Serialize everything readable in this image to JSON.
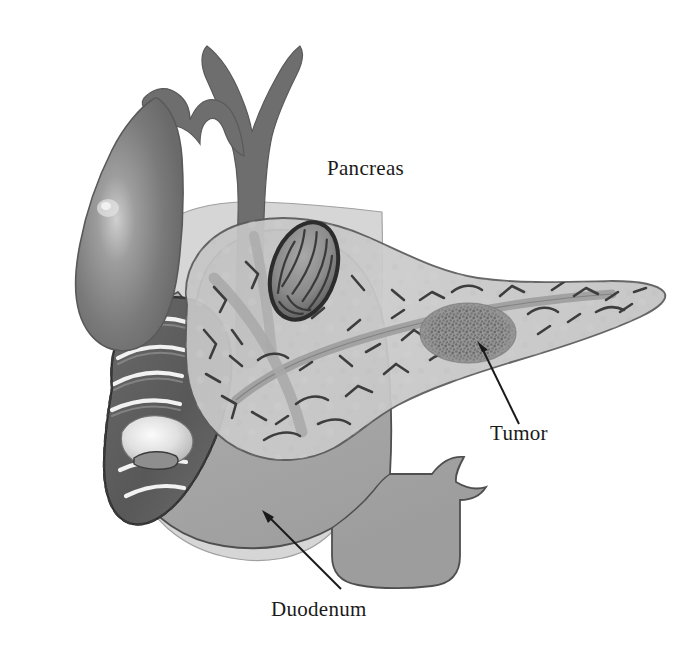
{
  "figure": {
    "background_color": "#ffffff",
    "width": 692,
    "height": 659
  },
  "labels": {
    "pancreas": "Pancreas",
    "tumor": "Tumor",
    "duodenum": "Duodenum"
  },
  "annotations": [
    {
      "name": "tumor-leader-line",
      "label": "Tumor",
      "arrow_from": [
        519,
        424
      ],
      "arrow_to": [
        477,
        341
      ],
      "arrowhead": "at-target"
    },
    {
      "name": "duodenum-leader-line",
      "label": "Duodenum",
      "arrow_from": [
        341,
        589
      ],
      "arrow_to": [
        262,
        510
      ],
      "arrowhead": "at-target"
    }
  ],
  "structures": [
    {
      "name": "stomach-antrum-background",
      "label": "Stomach antrum / background viscus",
      "fill": "#d2d2d2",
      "outline": "#8b8b8b",
      "note": "pale grey silhouette behind pancreas head"
    },
    {
      "name": "gallbladder",
      "label": "Gallbladder",
      "fill": "#7d7d7d",
      "outline": "#5a5a5a",
      "highlight": "#cfcfcf",
      "note": "pear shaped, specular highlight at left"
    },
    {
      "name": "common-bile-duct",
      "label": "Common bile duct and hepatic ducts",
      "fill": "#6e6e6e",
      "outline": "#5a5a5a",
      "note": "Y-shaped fork at top, descends through pancreas head"
    },
    {
      "name": "cystic-duct",
      "label": "Cystic duct",
      "fill": "#6e6e6e",
      "outline": "#5a5a5a"
    },
    {
      "name": "duodenum",
      "label": "Duodenum",
      "fill": "#a9a9a9",
      "outline": "#4f4f4f",
      "lumen_fill": "#5e5e5e",
      "fold_highlight": "#f2f2f2",
      "note": "C-loop, cut open on left to reveal mucosal folds and papilla"
    },
    {
      "name": "duodenal-papilla",
      "label": "Major duodenal papilla (ampulla of Vater)",
      "fill": "#ececec",
      "outline": "#6a6a6a"
    },
    {
      "name": "pancreas",
      "label": "Pancreas",
      "fill": "#c9c9c9",
      "outline": "#5b5b5b",
      "duct_color": "#9a9a9a",
      "ductule_color": "#3d3d3d",
      "note": "head, neck, body and tapering tail extending to the right"
    },
    {
      "name": "pancreatic-duct",
      "label": "Main pancreatic duct",
      "fill": "#a2a2a2",
      "outline": "#7c7c7c"
    },
    {
      "name": "tumor",
      "label": "Tumor",
      "fill": "#8e8e8e",
      "outline": "#6a6a6a",
      "texture": "stippled-granular",
      "center": [
        468,
        333
      ],
      "radius_x": 48,
      "radius_y": 30
    },
    {
      "name": "lymph-node",
      "label": "Striated nodular structure over pancreas head",
      "fill": "#909090",
      "outline": "#2e2e2e",
      "note": "dark oval with internal striations"
    }
  ],
  "palette": {
    "page_background": "#ffffff",
    "ink": "#1a1a1a",
    "outline_dark": "#4f4f4f",
    "organ_light": "#c9c9c9",
    "organ_mid": "#a9a9a9",
    "organ_dark": "#7d7d7d",
    "duct_grey": "#6e6e6e",
    "lumen_dark": "#5e5e5e",
    "highlight": "#f2f2f2"
  }
}
